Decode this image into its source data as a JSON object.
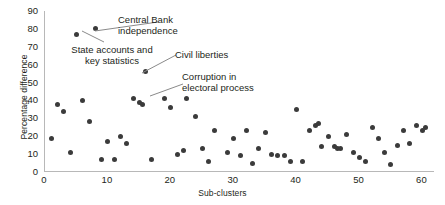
{
  "chart_data": {
    "type": "scatter",
    "title": "",
    "xlabel": "Sub-clusters",
    "ylabel": "Percentage difference",
    "xlim": [
      0,
      62
    ],
    "ylim": [
      0,
      90
    ],
    "xticks": [
      0,
      10,
      20,
      30,
      40,
      50,
      60
    ],
    "yticks": [
      0,
      10,
      20,
      30,
      40,
      50,
      60,
      70,
      80,
      90
    ],
    "grid": false,
    "legend": null,
    "marker_color": "#3b3b3b",
    "axis_color": "#b8b8b8",
    "series": [
      {
        "name": "Sub-cluster percentage difference",
        "points": [
          {
            "x": 1,
            "y": 19
          },
          {
            "x": 2,
            "y": 38
          },
          {
            "x": 3,
            "y": 34
          },
          {
            "x": 4,
            "y": 11
          },
          {
            "x": 5,
            "y": 77
          },
          {
            "x": 6,
            "y": 40
          },
          {
            "x": 7,
            "y": 28
          },
          {
            "x": 8,
            "y": 80
          },
          {
            "x": 9,
            "y": 7
          },
          {
            "x": 10,
            "y": 17
          },
          {
            "x": 11,
            "y": 7
          },
          {
            "x": 12,
            "y": 20
          },
          {
            "x": 13,
            "y": 16
          },
          {
            "x": 14,
            "y": 41
          },
          {
            "x": 15,
            "y": 39
          },
          {
            "x": 15.5,
            "y": 38
          },
          {
            "x": 16,
            "y": 56
          },
          {
            "x": 17,
            "y": 7
          },
          {
            "x": 19,
            "y": 41
          },
          {
            "x": 20,
            "y": 36
          },
          {
            "x": 21,
            "y": 10
          },
          {
            "x": 22,
            "y": 12
          },
          {
            "x": 22.5,
            "y": 41
          },
          {
            "x": 24,
            "y": 31
          },
          {
            "x": 25,
            "y": 13
          },
          {
            "x": 26,
            "y": 6
          },
          {
            "x": 27,
            "y": 23
          },
          {
            "x": 29,
            "y": 11
          },
          {
            "x": 30,
            "y": 19
          },
          {
            "x": 31,
            "y": 9
          },
          {
            "x": 32,
            "y": 23
          },
          {
            "x": 33,
            "y": 5
          },
          {
            "x": 34,
            "y": 13
          },
          {
            "x": 35,
            "y": 22
          },
          {
            "x": 36,
            "y": 10
          },
          {
            "x": 37,
            "y": 9
          },
          {
            "x": 38,
            "y": 9
          },
          {
            "x": 39,
            "y": 6
          },
          {
            "x": 40,
            "y": 35
          },
          {
            "x": 41,
            "y": 6
          },
          {
            "x": 42,
            "y": 23
          },
          {
            "x": 43,
            "y": 26
          },
          {
            "x": 43.5,
            "y": 27
          },
          {
            "x": 44,
            "y": 14
          },
          {
            "x": 45,
            "y": 20
          },
          {
            "x": 46,
            "y": 14
          },
          {
            "x": 46.5,
            "y": 13
          },
          {
            "x": 47,
            "y": 13
          },
          {
            "x": 48,
            "y": 21
          },
          {
            "x": 49,
            "y": 11
          },
          {
            "x": 50,
            "y": 8
          },
          {
            "x": 51,
            "y": 6
          },
          {
            "x": 52,
            "y": 25
          },
          {
            "x": 53,
            "y": 19
          },
          {
            "x": 54,
            "y": 11
          },
          {
            "x": 55,
            "y": 4
          },
          {
            "x": 56,
            "y": 15
          },
          {
            "x": 57,
            "y": 23
          },
          {
            "x": 58,
            "y": 16
          },
          {
            "x": 59,
            "y": 26
          },
          {
            "x": 60,
            "y": 23
          },
          {
            "x": 60.5,
            "y": 25
          }
        ]
      }
    ],
    "annotations": [
      {
        "id": "central-bank",
        "label": "Central Bank\nindependence",
        "target_x": 8,
        "target_y": 80
      },
      {
        "id": "state-accounts",
        "label": "State accounts and\nkey statistics",
        "target_x": 5,
        "target_y": 77
      },
      {
        "id": "civil-liberties",
        "label": "Civil liberties",
        "target_x": 16,
        "target_y": 56
      },
      {
        "id": "corruption",
        "label": "Corruption in\nelectoral process",
        "target_x": 22.5,
        "target_y": 41
      }
    ]
  }
}
